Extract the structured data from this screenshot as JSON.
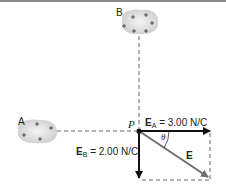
{
  "diagram": {
    "charges": [
      {
        "label": "A",
        "signs": [
          "+",
          "+",
          "+",
          "+"
        ]
      },
      {
        "label": "B",
        "signs": [
          "+",
          "+",
          "+",
          "+",
          "+",
          "+"
        ]
      }
    ],
    "point_label": "P",
    "vectors": {
      "EA": {
        "symbol": "E",
        "subscript": "A",
        "value_text": "= 3.00 N/C"
      },
      "EB": {
        "symbol": "E",
        "subscript": "B",
        "value_text": "= 2.00 N/C"
      },
      "E": {
        "symbol": "E"
      }
    },
    "angle_label": "θ",
    "colors": {
      "charge_fill": "#d9d9d9",
      "vector": "#111111",
      "resultant": "#6e6e6e",
      "dashed": "#555555",
      "top_border": "#8a8a8a"
    }
  }
}
